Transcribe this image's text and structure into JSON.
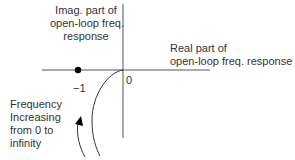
{
  "diagram": {
    "imag_axis_label": [
      "Imag. part of",
      "open-loop freq.",
      "response"
    ],
    "real_axis_label": [
      "Real part of",
      "open-loop freq. response"
    ],
    "origin_label": "0",
    "critical_point_label": "−1",
    "frequency_note": [
      "Frequency",
      "Increasing",
      "from 0 to",
      "infinity"
    ],
    "critical_point": {
      "real": -1,
      "imag": 0
    },
    "colors": {
      "axis": "#444444",
      "curve": "#333333",
      "point": "#000000"
    }
  }
}
